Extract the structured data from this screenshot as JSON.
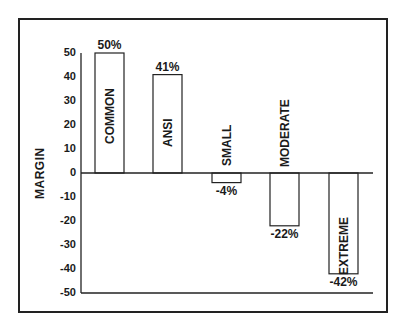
{
  "chart_data": {
    "type": "bar",
    "title": "",
    "xlabel": "",
    "ylabel": "MARGIN",
    "ylim": [
      -50,
      50
    ],
    "yticks": [
      50,
      40,
      30,
      20,
      10,
      0,
      -10,
      -20,
      -30,
      -40,
      -50
    ],
    "categories": [
      "COMMON",
      "ANSI",
      "SMALL",
      "MODERATE",
      "EXTREME"
    ],
    "values": [
      50,
      41,
      -4,
      -22,
      -42
    ],
    "value_labels": [
      "50%",
      "41%",
      "-4%",
      "-22%",
      "-42%"
    ],
    "grid": false,
    "legend": null,
    "bar_color": "#ffffff",
    "edge_color": "#222222"
  }
}
